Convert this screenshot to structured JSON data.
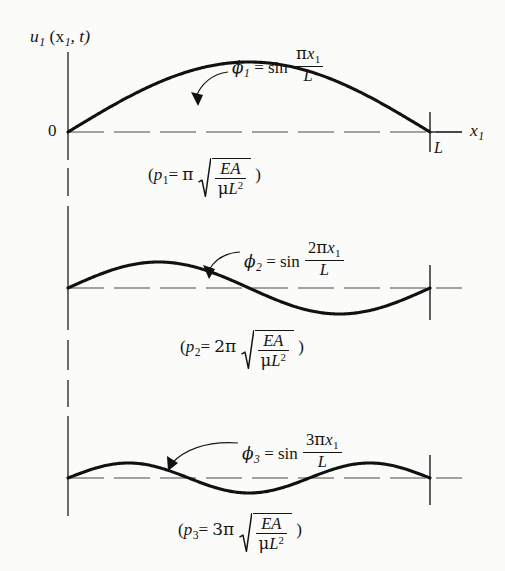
{
  "figure": {
    "background_color": "#fbfbf9",
    "ink_color": "#151515",
    "axes": {
      "y_axis_label": "u",
      "y_axis_label_sub": "1",
      "y_axis_label_args": "(x",
      "y_axis_label_args_sub": "1",
      "y_axis_label_args_tail": ", t)",
      "x_axis_label": "x",
      "x_axis_label_sub": "1",
      "origin_label": "0",
      "length_tick_label": "L"
    },
    "panels": [
      {
        "mode_number": 1,
        "shape_symbol": "ϕ",
        "shape_sub": "1",
        "equals": "=",
        "sin_text": "sin",
        "numerator_coeff": "",
        "numerator_pi": "π",
        "numerator_var": "x",
        "numerator_var_sub": "1",
        "denominator": "L",
        "freq_open": "(",
        "freq_symbol": "p",
        "freq_sub": "1",
        "freq_equals": "=",
        "freq_coeff": "π",
        "radicand_num": "EA",
        "radicand_den_mu": "μ",
        "radicand_den_L": "L",
        "radicand_den_exp": "2",
        "freq_close": ")"
      },
      {
        "mode_number": 2,
        "shape_symbol": "ϕ",
        "shape_sub": "2",
        "equals": "=",
        "sin_text": "sin",
        "numerator_coeff": "2",
        "numerator_pi": "π",
        "numerator_var": "x",
        "numerator_var_sub": "1",
        "denominator": "L",
        "freq_open": "(",
        "freq_symbol": "p",
        "freq_sub": "2",
        "freq_equals": "=",
        "freq_coeff": "2π",
        "radicand_num": "EA",
        "radicand_den_mu": "μ",
        "radicand_den_L": "L",
        "radicand_den_exp": "2",
        "freq_close": ")"
      },
      {
        "mode_number": 3,
        "shape_symbol": "ϕ",
        "shape_sub": "3",
        "equals": "=",
        "sin_text": "sin",
        "numerator_coeff": "3",
        "numerator_pi": "π",
        "numerator_var": "x",
        "numerator_var_sub": "1",
        "denominator": "L",
        "freq_open": "(",
        "freq_symbol": "p",
        "freq_sub": "3",
        "freq_equals": "=",
        "freq_coeff": "3π",
        "radicand_num": "EA",
        "radicand_den_mu": "μ",
        "radicand_den_L": "L",
        "radicand_den_exp": "2",
        "freq_close": ")"
      }
    ]
  },
  "chart_data": {
    "type": "line",
    "title": "",
    "xlabel": "x_1",
    "ylabel": "u_1 (x_1 , t)",
    "grid": false,
    "legend_position": "inline-annotations",
    "x_domain": [
      0,
      1
    ],
    "x_tick_labels": [
      "0",
      "L"
    ],
    "x_tick_values": [
      0,
      1
    ],
    "panels": [
      {
        "mode": 1,
        "function": "sin(pi*x1/L)",
        "half_waves": 1,
        "amplitude": 1.0,
        "px_amplitude": 70,
        "frequency": "p1 = pi*sqrt(EA/(mu*L^2))",
        "frequency_coefficient": 1,
        "annotation": "phi_1 = sin (pi x_1 / L)",
        "zero_crossings": [
          0,
          1
        ],
        "x": [
          0,
          0.0625,
          0.125,
          0.1875,
          0.25,
          0.3125,
          0.375,
          0.4375,
          0.5,
          0.5625,
          0.625,
          0.6875,
          0.75,
          0.8125,
          0.875,
          0.9375,
          1
        ],
        "y": [
          0,
          0.1951,
          0.3827,
          0.5556,
          0.7071,
          0.8315,
          0.9239,
          0.9808,
          1,
          0.9808,
          0.9239,
          0.8315,
          0.7071,
          0.5556,
          0.3827,
          0.1951,
          0
        ]
      },
      {
        "mode": 2,
        "function": "sin(2*pi*x1/L)",
        "half_waves": 2,
        "amplitude": 1.0,
        "px_amplitude": 26,
        "frequency": "p2 = 2*pi*sqrt(EA/(mu*L^2))",
        "frequency_coefficient": 2,
        "annotation": "phi_2 = sin (2 pi x_1 / L)",
        "zero_crossings": [
          0,
          0.5,
          1
        ],
        "x": [
          0,
          0.0625,
          0.125,
          0.1875,
          0.25,
          0.3125,
          0.375,
          0.4375,
          0.5,
          0.5625,
          0.625,
          0.6875,
          0.75,
          0.8125,
          0.875,
          0.9375,
          1
        ],
        "y": [
          0,
          0.3827,
          0.7071,
          0.9239,
          1,
          0.9239,
          0.7071,
          0.3827,
          0,
          -0.3827,
          -0.7071,
          -0.9239,
          -1,
          -0.9239,
          -0.7071,
          -0.3827,
          0
        ]
      },
      {
        "mode": 3,
        "function": "sin(3*pi*x1/L)",
        "half_waves": 3,
        "amplitude": 1.0,
        "px_amplitude": 15,
        "frequency": "p3 = 3*pi*sqrt(EA/(mu*L^2))",
        "frequency_coefficient": 3,
        "annotation": "phi_3 = sin (3 pi x_1 / L)",
        "zero_crossings": [
          0,
          0.3333,
          0.6667,
          1
        ],
        "x": [
          0,
          0.0625,
          0.125,
          0.1875,
          0.25,
          0.3125,
          0.375,
          0.4375,
          0.5,
          0.5625,
          0.625,
          0.6875,
          0.75,
          0.8125,
          0.875,
          0.9375,
          1
        ],
        "y": [
          0,
          0.5556,
          0.9239,
          0.9808,
          0.7071,
          0.1951,
          -0.3827,
          -0.8315,
          -1,
          -0.8315,
          -0.3827,
          0.1951,
          0.7071,
          0.9808,
          0.9239,
          0.5556,
          0
        ]
      }
    ]
  }
}
